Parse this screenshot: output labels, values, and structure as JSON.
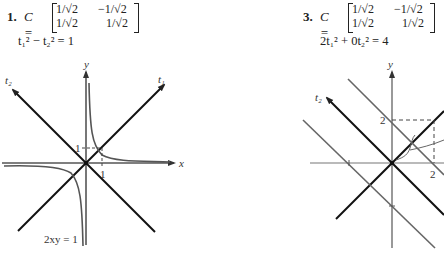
{
  "problems": [
    {
      "number": "1.",
      "matrix_label": "C =",
      "matrix": [
        [
          "1/√2",
          "−1/√2"
        ],
        [
          "1/√2",
          "1/√2"
        ]
      ],
      "equation": "t₁² − t₂² = 1",
      "graph": {
        "axis_x_label": "x",
        "axis_y_label": "y",
        "t1_label": "t₁",
        "t2_label": "t₂",
        "tick_x": "1",
        "tick_y": "1",
        "curve_label": "2xy = 1"
      }
    },
    {
      "number": "3.",
      "matrix_label": "C =",
      "matrix": [
        [
          "1/√2",
          "−1/√2"
        ],
        [
          "1/√2",
          "1/√2"
        ]
      ],
      "equation": "2t₁² + 0t₂² = 4",
      "graph": {
        "axis_y_label": "y",
        "t2_label": "t₂",
        "tick_x": "2",
        "tick_y": "2",
        "bottom_caption": "2 ... 2"
      }
    }
  ],
  "colors": {
    "ink": "#222222",
    "gray_line": "#777777"
  }
}
